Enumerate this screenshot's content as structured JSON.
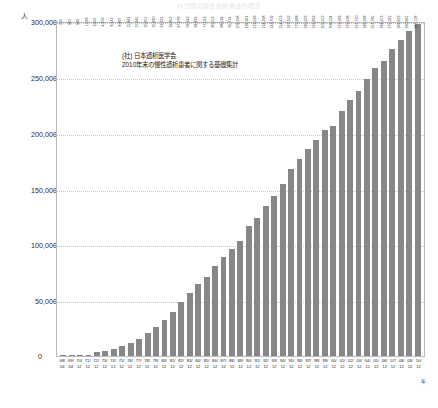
{
  "top_title": "わが国の慢性透析療法の現況",
  "axis": {
    "unit_label": "人",
    "year_unit": "年",
    "zero_label": "0",
    "y_ticks": [
      "300,000",
      "250,000",
      "200,000",
      "150,000",
      "100,000",
      "50,000"
    ]
  },
  "legend": {
    "line1": "(社) 日本透析医学会",
    "line2": "2010年末の慢性透析患者に関する基礎集計"
  },
  "chart_data": {
    "type": "bar",
    "title": "わが国の慢性透析療法の現況",
    "xlabel": "年",
    "ylabel": "人",
    "ylim": [
      0,
      300000
    ],
    "y_ticks": [
      0,
      50000,
      100000,
      150000,
      200000,
      250000,
      300000
    ],
    "grid": true,
    "legend_position": "inside-top-left",
    "series_name": "慢性透析患者数",
    "bar_color": "#878789",
    "categories": [
      "68/04",
      "69/04",
      "70/12",
      "71/12",
      "72/12",
      "73/12",
      "74/12",
      "75/12",
      "76/12",
      "77/12",
      "78/12",
      "79/12",
      "80/12",
      "81/12",
      "82/12",
      "83/12",
      "84/12",
      "85/12",
      "86/12",
      "87/12",
      "88/12",
      "89/12",
      "90/12",
      "91/12",
      "92/12",
      "93/12",
      "94/12",
      "95/12",
      "96/12",
      "97/12",
      "98/12",
      "99/12",
      "00/12",
      "01/12",
      "02/12",
      "03/12",
      "04/12",
      "05/12",
      "06/12",
      "07/12",
      "08/12",
      "09/12",
      "10/12"
    ],
    "category_years": [
      "68/",
      "69/",
      "70/",
      "71/",
      "72/",
      "73/",
      "74/",
      "75/",
      "76/",
      "77/",
      "78/",
      "79/",
      "80/",
      "81/",
      "82/",
      "83/",
      "84/",
      "85/",
      "86/",
      "87/",
      "88/",
      "89/",
      "90/",
      "91/",
      "92/",
      "93/",
      "94/",
      "95/",
      "96/",
      "97/",
      "98/",
      "99/",
      "00/",
      "01/",
      "02/",
      "03/",
      "04/",
      "05/",
      "06/",
      "07/",
      "08/",
      "09/",
      "10/"
    ],
    "category_months": [
      "04",
      "04",
      "12",
      "12",
      "12",
      "12",
      "12",
      "12",
      "12",
      "12",
      "12",
      "12",
      "12",
      "12",
      "12",
      "12",
      "12",
      "12",
      "12",
      "12",
      "12",
      "12",
      "12",
      "12",
      "12",
      "12",
      "12",
      "12",
      "12",
      "12",
      "12",
      "12",
      "12",
      "12",
      "12",
      "12",
      "12",
      "12",
      "12",
      "12",
      "12",
      "12",
      "12"
    ],
    "values": [
      215,
      901,
      949,
      1026,
      3631,
      4193,
      6143,
      8667,
      11843,
      15645,
      20651,
      25820,
      32331,
      39852,
      47978,
      56342,
      64823,
      71013,
      80553,
      88534,
      95714,
      103296,
      116303,
      123926,
      134298,
      143709,
      154413,
      167192,
      175988,
      185322,
      193832,
      202313,
      206134,
      219183,
      229538,
      237710,
      248166,
      257765,
      264473,
      275242,
      282622,
      290661,
      297126
    ],
    "value_labels": [
      "215",
      "901",
      "949",
      "1,026",
      "3,631",
      "4,193",
      "6,143",
      "8,667",
      "11,843",
      "15,645",
      "20,651",
      "25,820",
      "32,331",
      "39,852",
      "47,978",
      "56,342",
      "64,823",
      "71,013",
      "80,553",
      "88,534",
      "95,714",
      "103,296",
      "116,303",
      "123,926",
      "134,298",
      "143,709",
      "154,413",
      "167,192",
      "175,988",
      "185,322",
      "193,832",
      "202,313",
      "206,134",
      "219,183",
      "229,538",
      "237,710",
      "248,166",
      "257,765",
      "264,473",
      "275,242",
      "282,622",
      "290,661",
      "297,126"
    ]
  }
}
